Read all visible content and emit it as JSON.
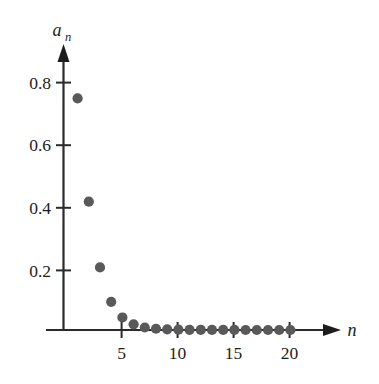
{
  "chart_data": {
    "type": "scatter",
    "title": "",
    "subtitle": "",
    "xlabel": "n",
    "ylabel": "a_n",
    "ylabel_base": "a",
    "ylabel_subscript": "n",
    "x": [
      1,
      2,
      3,
      4,
      5,
      6,
      7,
      8,
      9,
      10,
      11,
      12,
      13,
      14,
      15,
      16,
      17,
      18,
      19,
      20
    ],
    "values": [
      0.74,
      0.41,
      0.2,
      0.09,
      0.04,
      0.018,
      0.008,
      0.004,
      0.002,
      0.001,
      0.0005,
      0.0003,
      0.0002,
      0.0001,
      0.0001,
      0.0,
      0.0,
      0.0,
      0.0,
      0.0
    ],
    "xlim": [
      0,
      23.5
    ],
    "ylim": [
      0,
      0.95
    ],
    "xticks": [
      5,
      10,
      15,
      20
    ],
    "xtick_labels": [
      "5",
      "10",
      "15",
      "20"
    ],
    "yticks": [
      0.2,
      0.4,
      0.6,
      0.8
    ],
    "ytick_labels": [
      "0.2",
      "0.4",
      "0.6",
      "0.8"
    ],
    "grid": false,
    "legend": null,
    "marker": "circle",
    "marker_color": "#595959",
    "axis_color": "#2b2b2b",
    "background": "#ffffff"
  },
  "axis_labels": {
    "x_axis_name": "n",
    "y_axis_name_base": "a",
    "y_axis_name_sub": "n"
  },
  "y_tick_text": {
    "t0": "0.2",
    "t1": "0.4",
    "t2": "0.6",
    "t3": "0.8"
  },
  "x_tick_text": {
    "t0": "5",
    "t1": "10",
    "t2": "15",
    "t3": "20"
  }
}
